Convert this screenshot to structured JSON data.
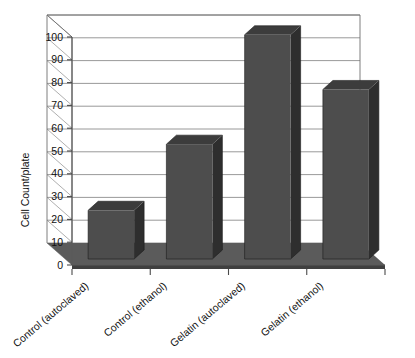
{
  "chart_data": {
    "type": "bar",
    "title": "",
    "xlabel": "",
    "ylabel": "Cell Count/plate",
    "categories": [
      "Control (autoclaved)",
      "Control (ethanol)",
      "Gelatin (autoclaved)",
      "Gelatin (ethanol)"
    ],
    "values": [
      24,
      53,
      101,
      77
    ],
    "ylim": [
      0,
      100
    ],
    "yticks": [
      0,
      10,
      20,
      30,
      40,
      50,
      60,
      70,
      80,
      90,
      100
    ],
    "ytick_labels": [
      "0",
      "10",
      "20",
      "30",
      "40",
      "50",
      "60",
      "70",
      "80",
      "90",
      "100"
    ],
    "grid": true,
    "legend": false,
    "legend_position": "none",
    "style": "3d-column",
    "series": [
      {
        "name": "Cell Count/plate",
        "values": [
          24,
          53,
          101,
          77
        ]
      }
    ],
    "colors": {
      "bar_front": "#4d4d4d",
      "bar_top": "#3c3c3c",
      "bar_side": "#2e2e2e",
      "floor_top": "#5b5b5b",
      "floor_front": "#3f3f3f",
      "gridline": "#8d8d8d",
      "background": "#ffffff",
      "text": "#111111"
    }
  }
}
